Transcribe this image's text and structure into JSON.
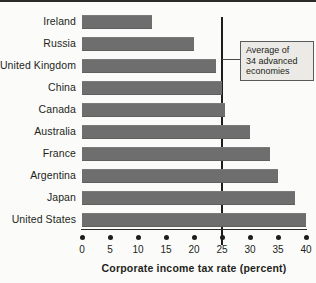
{
  "chart_data": {
    "type": "bar",
    "orientation": "horizontal",
    "title": "",
    "xlabel": "Corporate income tax rate (percent)",
    "ylabel": "",
    "xlim": [
      0,
      40
    ],
    "xticks": [
      0,
      5,
      10,
      15,
      20,
      25,
      30,
      35,
      40
    ],
    "xtick_labels": [
      "0",
      "5",
      "10",
      "15",
      "20",
      "25",
      "30",
      "35",
      "40"
    ],
    "grid": false,
    "legend": null,
    "bar_color": "#6e6e6e",
    "categories": [
      "Ireland",
      "Russia",
      "United Kingdom",
      "China",
      "Canada",
      "Australia",
      "France",
      "Argentina",
      "Japan",
      "United States"
    ],
    "values": [
      12.5,
      20,
      24,
      25,
      25.5,
      30,
      33.5,
      35,
      38,
      40
    ],
    "annotations": [
      {
        "text": "Average of 34 advanced economies",
        "line1": "Average of",
        "line2": "34 advanced",
        "line3": "economies",
        "reference_value": 25,
        "marker": "vertical-line"
      }
    ]
  },
  "axis": {
    "title": "Corporate income tax rate (percent)"
  },
  "callout": {
    "line1": "Average of",
    "line2": "34 advanced",
    "line3": "economies"
  }
}
